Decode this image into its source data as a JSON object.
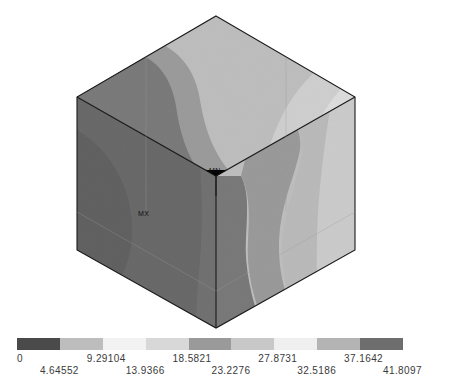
{
  "app": {
    "kind": "fea-contour-plot",
    "background_color": "#ffffff"
  },
  "model": {
    "shape": "cube",
    "view": "isometric",
    "min_marker_label": "MN",
    "max_marker_label": "MX"
  },
  "colorbar": {
    "orientation": "horizontal",
    "band_count": 9,
    "band_colors": [
      "#4a4a4a",
      "#bdbdbd",
      "#f2f2f2",
      "#d8d8d8",
      "#9a9a9a",
      "#c8c8c8",
      "#efefef",
      "#b4b4b4",
      "#6e6e6e"
    ],
    "tick_labels_top": [
      "0",
      "9.29104",
      "18.5821",
      "27.8731",
      "37.1642"
    ],
    "tick_labels_bottom": [
      "4.64552",
      "13.9366",
      "23.2276",
      "32.5186",
      "41.8097"
    ],
    "range_min": 0,
    "range_max": 41.8097
  },
  "chart_data": {
    "type": "heatmap",
    "title": "",
    "xlabel": "",
    "ylabel": "",
    "legend_position": "bottom",
    "grid": false,
    "colormap": "grayscale-banded",
    "levels": [
      0,
      4.64552,
      9.29104,
      13.9366,
      18.5821,
      23.2276,
      27.8731,
      32.5186,
      37.1642,
      41.8097
    ],
    "level_labels_upper": [
      "0",
      "9.29104",
      "18.5821",
      "27.8731",
      "37.1642"
    ],
    "level_labels_lower": [
      "4.64552",
      "13.9366",
      "23.2276",
      "32.5186",
      "41.8097"
    ],
    "value_min": 0,
    "value_max": 41.8097,
    "min_location_label": "MN",
    "max_location_label": "MX",
    "faces": [
      {
        "name": "top",
        "bands": 4,
        "dominant_value_range": [
          9.29104,
          32.5186
        ]
      },
      {
        "name": "left",
        "bands": 2,
        "dominant_value_range": [
          4.64552,
          18.5821
        ]
      },
      {
        "name": "right",
        "bands": 4,
        "dominant_value_range": [
          13.9366,
          37.1642
        ]
      }
    ]
  }
}
